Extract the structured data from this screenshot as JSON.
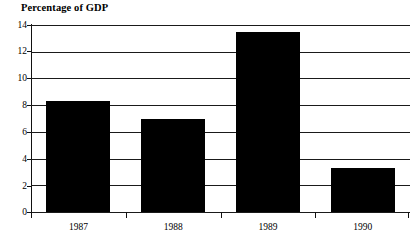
{
  "chart_data": {
    "type": "bar",
    "title": "Percentage of GDP",
    "xlabel": "",
    "ylabel": "",
    "categories": [
      "1987",
      "1988",
      "1989",
      "1990"
    ],
    "values": [
      8.3,
      6.95,
      13.45,
      3.3
    ],
    "series": [
      {
        "name": "Percentage of GDP",
        "values": [
          8.3,
          6.95,
          13.45,
          3.3
        ],
        "color": "#000000"
      }
    ],
    "ylim": [
      0,
      14
    ],
    "yticks": [
      0,
      2,
      4,
      6,
      8,
      10,
      12,
      14
    ],
    "ytick_labels": [
      "0",
      "2",
      "4",
      "6",
      "8",
      "10",
      "12",
      "14"
    ],
    "grid": true,
    "grid_axis": "y",
    "legend": false,
    "legend_position": "none",
    "bar_color": "#000000",
    "axis_color": "#111111",
    "background": "#ffffff"
  }
}
